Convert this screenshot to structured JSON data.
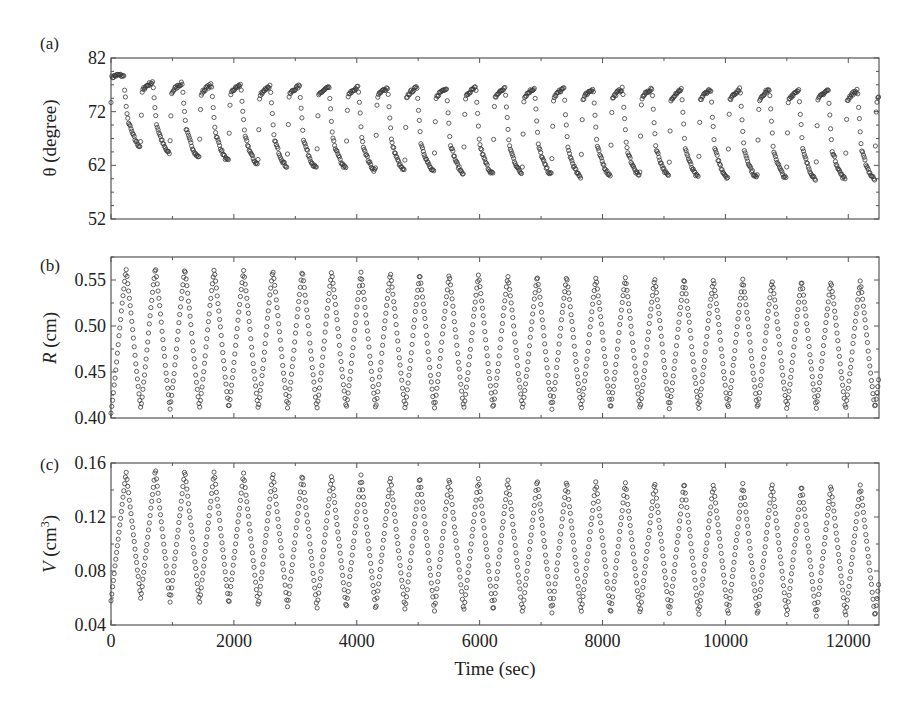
{
  "chart_data": [
    {
      "id": "a",
      "type": "scatter",
      "panel_label": "(a)",
      "ylabel": "θ (degree)",
      "xlabel": "",
      "xlim": [
        0,
        12500
      ],
      "ylim": [
        52,
        82
      ],
      "yticks": [
        52,
        62,
        72,
        82
      ],
      "ytick_labels": [
        "52",
        "62",
        "72",
        "82"
      ],
      "yminor_step": 2.5,
      "xticks": [
        0,
        2000,
        4000,
        6000,
        8000,
        10000,
        12000
      ],
      "xminor_step": 1000,
      "frame_px": {
        "x0": 111,
        "x1": 879,
        "y0": 58,
        "y1": 219
      },
      "waveform": "sawtooth-decay",
      "period_sec": 478,
      "first_rise_sec": 0,
      "cycles": [
        {
          "plateau_start": 78.5,
          "peak": 78.8,
          "trough": 65.5
        },
        {
          "plateau_start": 75.5,
          "peak": 77.5,
          "trough": 64.2
        },
        {
          "plateau_start": 75.0,
          "peak": 77.3,
          "trough": 63.5
        },
        {
          "plateau_start": 74.8,
          "peak": 77.0,
          "trough": 62.8
        },
        {
          "plateau_start": 74.8,
          "peak": 77.0,
          "trough": 62.2
        },
        {
          "plateau_start": 74.5,
          "peak": 76.8,
          "trough": 61.8
        },
        {
          "plateau_start": 74.5,
          "peak": 76.8,
          "trough": 61.5
        },
        {
          "plateau_start": 74.5,
          "peak": 76.6,
          "trough": 61.5
        },
        {
          "plateau_start": 74.3,
          "peak": 76.6,
          "trough": 61.0
        },
        {
          "plateau_start": 74.2,
          "peak": 76.5,
          "trough": 61.0
        },
        {
          "plateau_start": 74.2,
          "peak": 76.5,
          "trough": 60.8
        },
        {
          "plateau_start": 74.0,
          "peak": 76.5,
          "trough": 60.6
        },
        {
          "plateau_start": 74.0,
          "peak": 76.5,
          "trough": 60.5
        },
        {
          "plateau_start": 74.0,
          "peak": 76.4,
          "trough": 60.5
        },
        {
          "plateau_start": 74.0,
          "peak": 76.4,
          "trough": 60.3
        },
        {
          "plateau_start": 73.8,
          "peak": 76.4,
          "trough": 59.8
        },
        {
          "plateau_start": 73.8,
          "peak": 76.3,
          "trough": 60.2
        },
        {
          "plateau_start": 73.8,
          "peak": 76.3,
          "trough": 60.0
        },
        {
          "plateau_start": 73.8,
          "peak": 76.3,
          "trough": 60.0
        },
        {
          "plateau_start": 73.6,
          "peak": 76.2,
          "trough": 59.8
        },
        {
          "plateau_start": 73.6,
          "peak": 76.2,
          "trough": 59.8
        },
        {
          "plateau_start": 73.6,
          "peak": 76.2,
          "trough": 59.7
        },
        {
          "plateau_start": 73.5,
          "peak": 76.2,
          "trough": 59.6
        },
        {
          "plateau_start": 73.5,
          "peak": 76.1,
          "trough": 59.5
        },
        {
          "plateau_start": 73.5,
          "peak": 76.1,
          "trough": 59.5
        },
        {
          "plateau_start": 73.5,
          "peak": 76.0,
          "trough": 59.5
        },
        {
          "plateau_start": 73.4,
          "peak": 76.0,
          "trough": 59.4
        }
      ]
    },
    {
      "id": "b",
      "type": "scatter",
      "panel_label": "(b)",
      "ylabel": "R (cm)",
      "ylabel_italic_part": "R",
      "ylabel_rest": " (cm)",
      "xlabel": "",
      "xlim": [
        0,
        12500
      ],
      "ylim": [
        0.4,
        0.575
      ],
      "yticks": [
        0.4,
        0.45,
        0.5,
        0.55
      ],
      "ytick_labels": [
        "0.40",
        "0.45",
        "0.50",
        "0.55"
      ],
      "yminor_step": 0.025,
      "xticks": [
        0,
        2000,
        4000,
        6000,
        8000,
        10000,
        12000
      ],
      "xminor_step": 1000,
      "frame_px": {
        "x0": 111,
        "x1": 879,
        "y0": 257,
        "y1": 418
      },
      "waveform": "triangle-rounded",
      "period_sec": 478,
      "first_peak_sec": 245,
      "start_value": 0.405,
      "peaks": [
        0.562,
        0.564,
        0.563,
        0.562,
        0.561,
        0.561,
        0.56,
        0.559,
        0.558,
        0.558,
        0.557,
        0.556,
        0.556,
        0.555,
        0.555,
        0.554,
        0.553,
        0.553,
        0.552,
        0.552,
        0.551,
        0.551,
        0.55,
        0.55,
        0.549,
        0.549
      ],
      "troughs": [
        0.41,
        0.41,
        0.41,
        0.41,
        0.41,
        0.41,
        0.41,
        0.41,
        0.41,
        0.41,
        0.41,
        0.41,
        0.41,
        0.41,
        0.41,
        0.41,
        0.41,
        0.41,
        0.41,
        0.41,
        0.41,
        0.41,
        0.41,
        0.41,
        0.41,
        0.41
      ]
    },
    {
      "id": "c",
      "type": "scatter",
      "panel_label": "(c)",
      "ylabel": "V (cm³)",
      "ylabel_italic_part": "V",
      "ylabel_rest": " (cm",
      "ylabel_sup": "3",
      "ylabel_close": ")",
      "xlabel": "Time (sec)",
      "xlim": [
        0,
        12500
      ],
      "ylim": [
        0.04,
        0.16
      ],
      "yticks": [
        0.04,
        0.08,
        0.12,
        0.16
      ],
      "ytick_labels": [
        "0.04",
        "0.08",
        "0.12",
        "0.16"
      ],
      "yminor_step": 0.02,
      "xticks": [
        0,
        2000,
        4000,
        6000,
        8000,
        10000,
        12000
      ],
      "xtick_labels": [
        "0",
        "2000",
        "4000",
        "6000",
        "8000",
        "10000",
        "12000"
      ],
      "xminor_step": 1000,
      "frame_px": {
        "x0": 111,
        "x1": 879,
        "y0": 463,
        "y1": 625
      },
      "waveform": "triangle",
      "period_sec": 478,
      "first_peak_sec": 245,
      "start_value": 0.058,
      "peaks": [
        0.154,
        0.156,
        0.155,
        0.154,
        0.153,
        0.153,
        0.152,
        0.151,
        0.151,
        0.15,
        0.15,
        0.149,
        0.149,
        0.148,
        0.148,
        0.147,
        0.147,
        0.146,
        0.146,
        0.146,
        0.145,
        0.145,
        0.145,
        0.144,
        0.144,
        0.144
      ],
      "troughs": [
        0.059,
        0.057,
        0.056,
        0.055,
        0.054,
        0.053,
        0.052,
        0.052,
        0.051,
        0.051,
        0.05,
        0.05,
        0.05,
        0.049,
        0.049,
        0.049,
        0.048,
        0.048,
        0.048,
        0.047,
        0.047,
        0.047,
        0.047,
        0.046,
        0.046,
        0.046
      ]
    }
  ],
  "figure": {
    "marker": "open-circle",
    "marker_color": "#3a3a3a",
    "frame_color": "#555555"
  }
}
